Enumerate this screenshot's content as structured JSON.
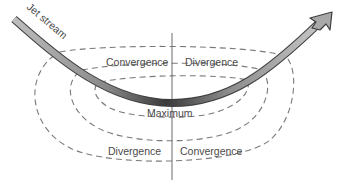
{
  "diagram": {
    "jet_stream_label": "Jet stream",
    "upper_left_label": "Convergence",
    "upper_right_label": "Divergence",
    "center_label": "Maximum",
    "lower_left_label": "Divergence",
    "lower_right_label": "Convergence",
    "colors": {
      "jet_stream_fill_light": "#c4c4c4",
      "jet_stream_fill_dark": "#3a3a3a",
      "jet_stream_outline": "#3d3d3d",
      "contour": "#7a7a7a",
      "axis": "#6a6a6a",
      "text": "#4a4a4a"
    }
  }
}
